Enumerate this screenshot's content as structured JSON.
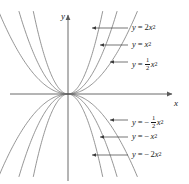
{
  "figure": {
    "background_color": "#ffffff",
    "curve_color": "#7a7a7a",
    "axis_color": "#5a5a5a",
    "text_color": "#1a1a1a",
    "width": 189,
    "height": 184
  },
  "axes": {
    "x_label": "x",
    "y_label": "y",
    "origin": {
      "x": 68,
      "y": 94
    },
    "x_axis": {
      "start_x": 10,
      "end_x": 172,
      "y": 94
    },
    "y_axis": {
      "x": 68,
      "start_y": 15,
      "end_y": 181
    }
  },
  "labels": {
    "upper": [
      {
        "id": "y-eq-2x2",
        "text": "y = 2x²",
        "coef": 2,
        "y": 28,
        "arrow_x": 92,
        "line_end_x": 128
      },
      {
        "id": "y-eq-x2",
        "text": "y = x²",
        "coef": 1,
        "y": 45,
        "arrow_x": 100,
        "line_end_x": 128
      },
      {
        "id": "y-eq-half-x2",
        "text": "y = ½x²",
        "coef": 0.5,
        "y": 62,
        "arrow_x": 110,
        "line_end_x": 128
      }
    ],
    "lower": [
      {
        "id": "y-eq-neg-half-x2",
        "text": "y = −½x²",
        "coef": -0.5,
        "y": 120,
        "arrow_x": 110,
        "line_end_x": 128
      },
      {
        "id": "y-eq-neg-x2",
        "text": "y = −x²",
        "coef": -1,
        "y": 137,
        "arrow_x": 100,
        "line_end_x": 128
      },
      {
        "id": "y-eq-neg-2x2",
        "text": "y = −2x²",
        "coef": -2,
        "y": 155,
        "arrow_x": 92,
        "line_end_x": 128
      }
    ]
  },
  "chart_data": {
    "type": "line",
    "title": "",
    "xlabel": "x",
    "ylabel": "y",
    "grid": false,
    "legend_position": "inline-annotations",
    "xlim": [
      -2.6,
      4.0
    ],
    "ylim": [
      -3.4,
      3.4
    ],
    "series": [
      {
        "name": "y = 2x²",
        "equation": "y = 2x^2",
        "coefficient": 2,
        "color": "#7a7a7a",
        "x": [
          -1.35,
          -1.2,
          -1.0,
          -0.8,
          -0.6,
          -0.4,
          -0.2,
          0,
          0.2,
          0.4,
          0.6,
          0.8,
          1.0,
          1.2,
          1.35
        ],
        "y": [
          3.645,
          2.88,
          2.0,
          1.28,
          0.72,
          0.32,
          0.08,
          0,
          0.08,
          0.32,
          0.72,
          1.28,
          2.0,
          2.88,
          3.645
        ]
      },
      {
        "name": "y = x²",
        "equation": "y = x^2",
        "coefficient": 1,
        "color": "#7a7a7a",
        "x": [
          -1.9,
          -1.6,
          -1.3,
          -1.0,
          -0.7,
          -0.4,
          -0.2,
          0,
          0.2,
          0.4,
          0.7,
          1.0,
          1.3,
          1.6,
          1.9
        ],
        "y": [
          3.61,
          2.56,
          1.69,
          1.0,
          0.49,
          0.16,
          0.04,
          0,
          0.04,
          0.16,
          0.49,
          1.0,
          1.69,
          2.56,
          3.61
        ]
      },
      {
        "name": "y = ½x²",
        "equation": "y = (1/2)x^2",
        "coefficient": 0.5,
        "color": "#7a7a7a",
        "x": [
          -2.6,
          -2.2,
          -1.8,
          -1.4,
          -1.0,
          -0.6,
          -0.3,
          0,
          0.3,
          0.6,
          1.0,
          1.4,
          1.8,
          2.2,
          2.6
        ],
        "y": [
          3.38,
          2.42,
          1.62,
          0.98,
          0.5,
          0.18,
          0.045,
          0,
          0.045,
          0.18,
          0.5,
          0.98,
          1.62,
          2.42,
          3.38
        ]
      },
      {
        "name": "y = −½x²",
        "equation": "y = -(1/2)x^2",
        "coefficient": -0.5,
        "color": "#7a7a7a",
        "x": [
          -2.6,
          -2.2,
          -1.8,
          -1.4,
          -1.0,
          -0.6,
          -0.3,
          0,
          0.3,
          0.6,
          1.0,
          1.4,
          1.8,
          2.2,
          2.6
        ],
        "y": [
          -3.38,
          -2.42,
          -1.62,
          -0.98,
          -0.5,
          -0.18,
          -0.045,
          0,
          -0.045,
          -0.18,
          -0.5,
          -0.98,
          -1.62,
          -2.42,
          -3.38
        ]
      },
      {
        "name": "y = −x²",
        "equation": "y = -x^2",
        "coefficient": -1,
        "color": "#7a7a7a",
        "x": [
          -1.9,
          -1.6,
          -1.3,
          -1.0,
          -0.7,
          -0.4,
          -0.2,
          0,
          0.2,
          0.4,
          0.7,
          1.0,
          1.3,
          1.6,
          1.9
        ],
        "y": [
          -3.61,
          -2.56,
          -1.69,
          -1.0,
          -0.49,
          -0.16,
          -0.04,
          0,
          -0.04,
          -0.16,
          -0.49,
          -1.0,
          -1.69,
          -2.56,
          -3.61
        ]
      },
      {
        "name": "y = −2x²",
        "equation": "y = -2x^2",
        "coefficient": -2,
        "color": "#7a7a7a",
        "x": [
          -1.35,
          -1.2,
          -1.0,
          -0.8,
          -0.6,
          -0.4,
          -0.2,
          0,
          0.2,
          0.4,
          0.6,
          0.8,
          1.0,
          1.2,
          1.35
        ],
        "y": [
          -3.645,
          -2.88,
          -2.0,
          -1.28,
          -0.72,
          -0.32,
          -0.08,
          0,
          -0.08,
          -0.32,
          -0.72,
          -1.28,
          -2.0,
          -2.88,
          -3.645
        ]
      }
    ]
  }
}
